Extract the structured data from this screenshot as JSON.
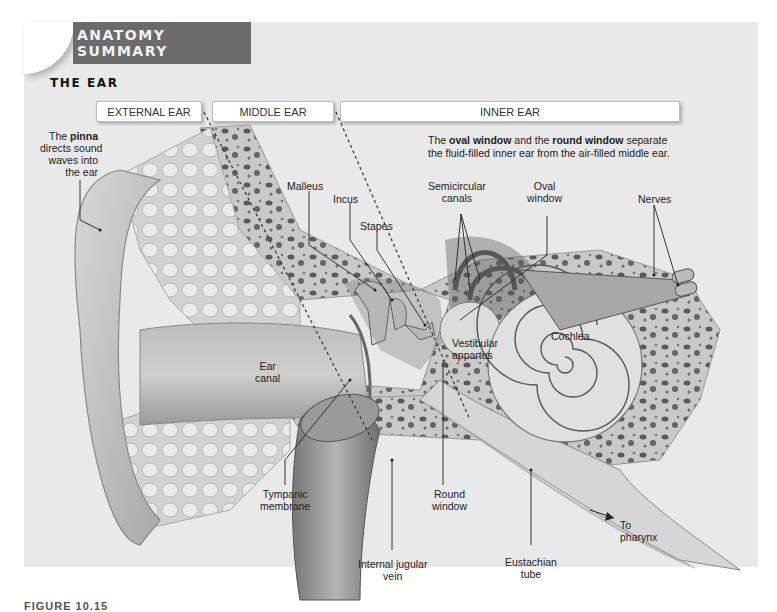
{
  "banner": {
    "label": "ANATOMY SUMMARY",
    "color": "#6b6b6b"
  },
  "section": {
    "title": "THE EAR"
  },
  "regions": [
    {
      "label": "EXTERNAL EAR"
    },
    {
      "label": "MIDDLE EAR"
    },
    {
      "label": "INNER EAR"
    }
  ],
  "note": {
    "part1": "The ",
    "bold1": "oval window",
    "part2": " and the ",
    "bold2": "round window",
    "part3": " separate",
    "line2": "the fluid-filled inner ear from the air-filled middle ear."
  },
  "pinna_note": {
    "prefix": "The ",
    "bold": "pinna",
    "line2": "directs sound",
    "line3": "waves into",
    "line4": "the ear"
  },
  "labels": {
    "malleus": "Malleus",
    "incus": "Incus",
    "stapes": "Stapes",
    "semicircular_1": "Semicircular",
    "semicircular_2": "canals",
    "oval_1": "Oval",
    "oval_2": "window",
    "nerves": "Nerves",
    "vestibular_1": "Vestibular",
    "vestibular_2": "appartus",
    "cochlea": "Cochlea",
    "ear_canal_1": "Ear",
    "ear_canal_2": "canal",
    "tympanic_1": "Tympanic",
    "tympanic_2": "membrane",
    "round_1": "Round",
    "round_2": "window",
    "jugular_1": "Internal jugular",
    "jugular_2": "vein",
    "eustachian_1": "Eustachian",
    "eustachian_2": "tube",
    "pharynx_1": "To",
    "pharynx_2": "pharynx"
  },
  "caption": {
    "label": "FIGURE 10.15"
  }
}
